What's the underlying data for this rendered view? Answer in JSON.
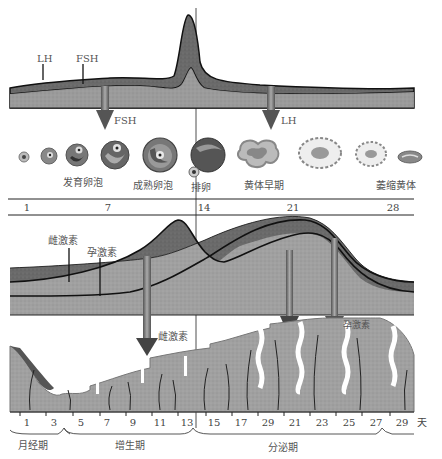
{
  "pituitary_panel": {
    "labels": {
      "lh": "LH",
      "fsh": "FSH"
    },
    "arrows": {
      "fsh": "FSH",
      "lh": "LH"
    }
  },
  "ovary_panel": {
    "stages": [
      {
        "label": "发育卵泡"
      },
      {
        "label": "成熟卵泡"
      },
      {
        "label": "排卵"
      },
      {
        "label": "黄体早期"
      },
      {
        "label": "萎缩黄体"
      }
    ],
    "day_ticks": [
      "1",
      "7",
      "14",
      "21",
      "28"
    ]
  },
  "ovarian_hormone_panel": {
    "labels": {
      "estrogen": "雌激素",
      "progesterone": "孕激素"
    },
    "arrows": {
      "estrogen": "雌激素",
      "progesterone": "孕激素"
    }
  },
  "endometrium_panel": {
    "day_ticks": [
      "1",
      "3",
      "5",
      "7",
      "9",
      "11",
      "13",
      "15",
      "17",
      "29",
      "21",
      "23",
      "25",
      "27",
      "29",
      "天"
    ],
    "phases": [
      {
        "label": "月经期"
      },
      {
        "label": "增生期"
      },
      {
        "label": "分泌期"
      }
    ]
  },
  "colors": {
    "dark_fill": "#6e6e6e",
    "light_fill": "#a3a3a3",
    "outline": "#111111",
    "tissue": "#9a9a9a"
  }
}
